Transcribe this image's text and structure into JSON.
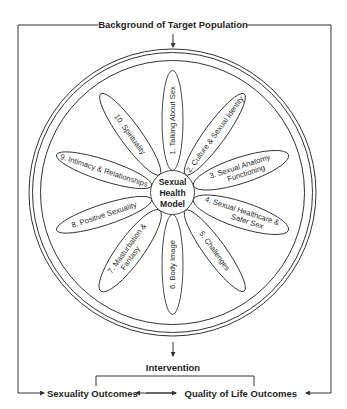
{
  "diagram": {
    "top_label": "Background of Target Population",
    "hub": {
      "line1": "Sexual",
      "line2": "Health",
      "line3": "Model"
    },
    "petals": [
      {
        "number": 1,
        "label": "1. Talking About Sex"
      },
      {
        "number": 2,
        "label": "2. Culture & Sexual Identity"
      },
      {
        "number": 3,
        "label_line1": "3. Sexual Anatomy",
        "label_line2": "Functioning"
      },
      {
        "number": 4,
        "label_line1": "4. Sexual Healthcare &",
        "label_line2": "Safer Sex"
      },
      {
        "number": 5,
        "label": "5. Challenges"
      },
      {
        "number": 6,
        "label": "6. Body Image"
      },
      {
        "number": 7,
        "label_line1": "7. Masturbation &",
        "label_line2": "Fantasy"
      },
      {
        "number": 8,
        "label": "8. Positive Sexuality"
      },
      {
        "number": 9,
        "label": "9. Intimacy &  Relationships"
      },
      {
        "number": 10,
        "label": "10. Spirituality"
      }
    ],
    "intervention_label": "Intervention",
    "outcomes": {
      "left": "Sexuality Outcomes",
      "right": "Quality of Life Outcomes"
    },
    "colors": {
      "line": "#333333",
      "text": "#1e1e1e",
      "background": "#ffffff"
    }
  }
}
